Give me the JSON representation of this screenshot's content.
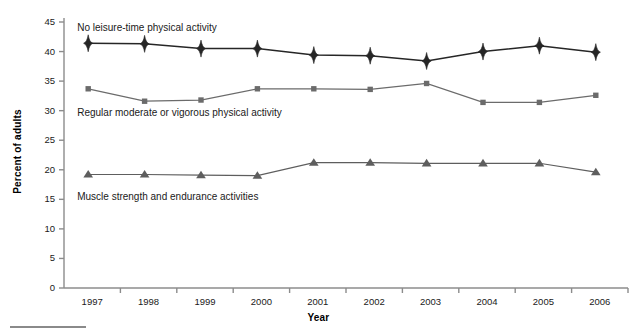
{
  "figure": {
    "background_color": "#ffffff",
    "bottom_rule": "horizontal-rule"
  },
  "axes": {
    "y_title": "Percent of adults",
    "x_title": "Year",
    "y_ticks": [
      "0",
      "5",
      "10",
      "15",
      "20",
      "25",
      "30",
      "35",
      "40",
      "45"
    ],
    "x_ticks": [
      "1997",
      "1998",
      "1999",
      "2000",
      "2001",
      "2002",
      "2003",
      "2004",
      "2005",
      "2006"
    ]
  },
  "series_labels": {
    "no_leisure": "No leisure-time physical activity",
    "regular_moderate": "Regular moderate or vigorous physical activity",
    "muscle_strength": "Muscle strength and endurance activities"
  },
  "colors": {
    "no_leisure": "#262626",
    "regular_moderate": "#6b6b6b",
    "muscle_strength": "#5e5e5e",
    "axis": "#8c8c8c",
    "text": "#1a1a1a"
  },
  "chart_data": {
    "type": "line",
    "title": "",
    "subtitle": "",
    "xlabel": "Year",
    "ylabel": "Percent of adults",
    "xlim": [
      1996.5,
      2006.5
    ],
    "ylim": [
      0,
      45
    ],
    "ytick_step": 5,
    "grid": false,
    "legend": "inline-annotations",
    "x": [
      1997,
      1998,
      1999,
      2000,
      2001,
      2002,
      2003,
      2004,
      2005,
      2006
    ],
    "categories": [
      "1997",
      "1998",
      "1999",
      "2000",
      "2001",
      "2002",
      "2003",
      "2004",
      "2005",
      "2006"
    ],
    "series": [
      {
        "name": "No leisure-time physical activity",
        "marker": "diamond",
        "color": "#262626",
        "values": [
          41.4,
          41.3,
          40.5,
          40.5,
          39.4,
          39.3,
          38.4,
          40.0,
          41.0,
          39.9
        ]
      },
      {
        "name": "Regular moderate or vigorous physical activity",
        "marker": "square",
        "color": "#6b6b6b",
        "values": [
          33.7,
          31.6,
          31.8,
          33.7,
          33.7,
          33.6,
          34.6,
          31.4,
          31.4,
          32.6
        ]
      },
      {
        "name": "Muscle strength and endurance activities",
        "marker": "triangle",
        "color": "#5e5e5e",
        "values": [
          19.2,
          19.2,
          19.1,
          19.0,
          21.2,
          21.2,
          21.1,
          21.1,
          21.1,
          19.6
        ]
      }
    ],
    "annotations": [
      {
        "text": "No leisure-time physical activity",
        "x": 1997.0,
        "y": 43.8
      },
      {
        "text": "Regular moderate or vigorous physical activity",
        "x": 1997.0,
        "y": 29.5
      },
      {
        "text": "Muscle strength and endurance activities",
        "x": 1997.0,
        "y": 15.3
      }
    ]
  }
}
